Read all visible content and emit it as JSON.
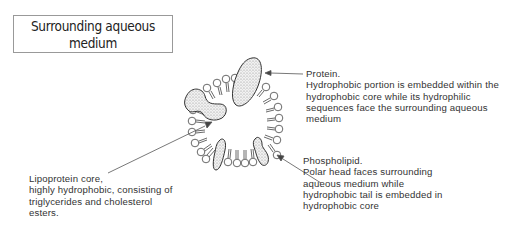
{
  "title_box": {
    "line1": "Surrounding aqueous",
    "line2": "medium"
  },
  "labels": {
    "protein": {
      "title": "Protein.",
      "lines": [
        "Hydrophobic portion is embedded within the",
        "hydrophobic core while its hydrophilic",
        "sequences face the surrounding aqueous",
        "medium"
      ]
    },
    "core": {
      "title": "Lipoprotein core,",
      "lines": [
        "highly hydrophobic, consisting of",
        "triglycerides and cholesterol",
        "esters."
      ]
    },
    "phospholipid": {
      "title": "Phospholipid.",
      "lines": [
        "Polar head faces surrounding",
        "aqueous medium while",
        "hydrophobic tail is embedded in",
        "hydrophobic core"
      ]
    }
  },
  "diagram": {
    "components": [
      "phospholipid monolayer",
      "apolipoprotein",
      "hydrophobic core"
    ]
  }
}
